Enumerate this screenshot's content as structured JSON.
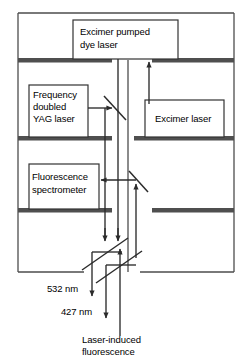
{
  "figure": {
    "colors": {
      "frame": "#4d4d4d",
      "shelf": "#4f4f4f",
      "box_border": "#333333",
      "box_fill": "#ffffff",
      "beam": "#2b2b2b",
      "text": "#000000",
      "background": "#ffffff"
    }
  },
  "boxes": {
    "dye_laser": {
      "label_line1": "Excimer pumped",
      "label_line2": "dye laser"
    },
    "yag_laser": {
      "label_line1": "Frequency",
      "label_line2": "doubled",
      "label_line3": "YAG laser"
    },
    "excimer_laser": {
      "label": "Excimer laser"
    },
    "spectrometer": {
      "label_line1": "Fluorescence",
      "label_line2": "spectrometer"
    }
  },
  "annotations": {
    "beam_532": "532 nm",
    "beam_427": "427 nm",
    "lif_line1": "Laser-induced",
    "lif_line2": "fluorescence"
  },
  "optics": {
    "beamsplitter_upper": "beamsplitter",
    "mirror_collect": "mirror",
    "mirror_lower_upper": "mirror",
    "mirror_lower_lower": "mirror"
  }
}
